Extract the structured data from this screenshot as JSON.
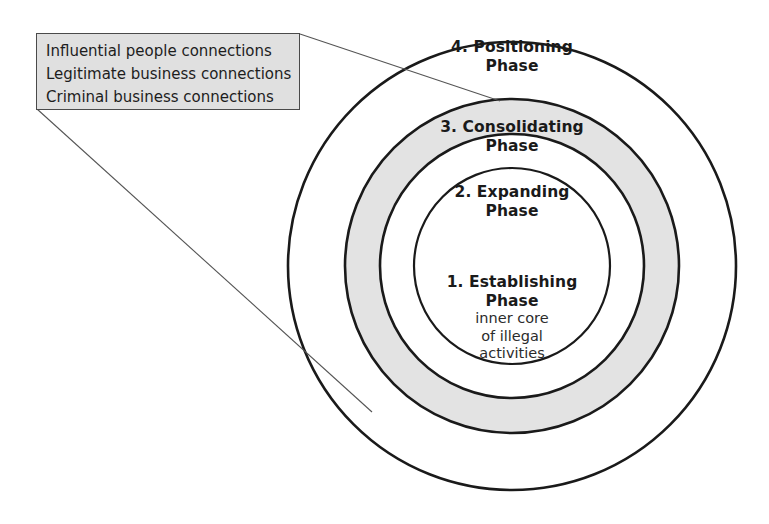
{
  "diagram": {
    "colors": {
      "stroke": "#1a1a1a",
      "ring_shaded_fill": "#e3e3e3",
      "ring_plain_fill": "#ffffff",
      "callout_fill": "#e0e0e0",
      "callout_border": "#4a4a4a",
      "leader_line": "#555555",
      "text": "#1a1a1a"
    },
    "rings": [
      {
        "index": 4,
        "name": "positioning-phase",
        "label_number": "4. Positioning",
        "label_phase": "Phase",
        "shaded": false,
        "cx": 512,
        "cy": 266,
        "r": 224
      },
      {
        "index": 3,
        "name": "consolidating-phase",
        "label_number": "3. Consolidating",
        "label_phase": "Phase",
        "shaded": true,
        "cx": 512,
        "cy": 266,
        "r": 167
      },
      {
        "index": 2,
        "name": "expanding-phase",
        "label_number": "2. Expanding",
        "label_phase": "Phase",
        "shaded": false,
        "cx": 512,
        "cy": 266,
        "r": 132
      },
      {
        "index": 1,
        "name": "establishing-phase",
        "label_number": "1. Establishing",
        "label_phase": "Phase",
        "sub_lines": [
          "inner core",
          "of illegal",
          "activities"
        ],
        "shaded": false,
        "cx": 512,
        "cy": 266,
        "r": 98
      }
    ],
    "callout": {
      "name": "connections-callout",
      "lines": [
        "Influential people connections",
        "Legitimate business connections",
        "Criminal business connections"
      ],
      "leaders": [
        {
          "name": "leader-line-upper",
          "x1": 300,
          "y1": 34,
          "x2": 500,
          "y2": 101
        },
        {
          "name": "leader-line-lower",
          "x1": 37,
          "y1": 109,
          "x2": 372,
          "y2": 412
        }
      ]
    }
  }
}
